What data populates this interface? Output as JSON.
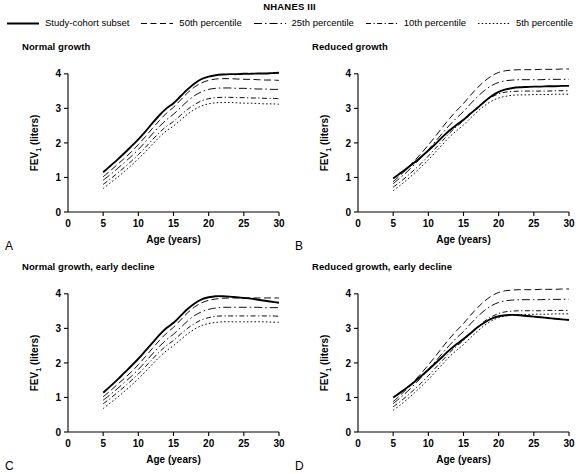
{
  "legend": {
    "title": "NHANES III",
    "items": [
      {
        "label": "Study-cohort subset",
        "style": "solid"
      },
      {
        "label": "50th percentile",
        "style": "dashed"
      },
      {
        "label": "25th percentile",
        "style": "dash-dot"
      },
      {
        "label": "10th percentile",
        "style": "dash-dot-dot"
      },
      {
        "label": "5th percentile",
        "style": "dotted"
      }
    ]
  },
  "axes": {
    "xlabel": "Age (years)",
    "ylabel_main": "FEV",
    "ylabel_sub": "1",
    "ylabel_unit": " (liters)",
    "xticks": [
      "0",
      "5",
      "10",
      "15",
      "20",
      "25",
      "30"
    ],
    "yticks": [
      "0",
      "1",
      "2",
      "3",
      "4"
    ],
    "xlim": [
      0,
      30
    ],
    "ylim": [
      0,
      4.4
    ]
  },
  "panels": [
    {
      "letter": "A",
      "title": "Normal growth"
    },
    {
      "letter": "B",
      "title": "Reduced growth"
    },
    {
      "letter": "C",
      "title": "Normal growth, early decline"
    },
    {
      "letter": "D",
      "title": "Reduced growth, early decline"
    }
  ],
  "chart_data": {
    "type": "line",
    "title": "NHANES III",
    "xlabel": "Age (years)",
    "ylabel": "FEV1 (liters)",
    "xlim": [
      0,
      30
    ],
    "ylim": [
      0,
      4.4
    ],
    "grid": false,
    "legend_position": "top",
    "x": [
      5,
      6,
      7,
      8,
      9,
      10,
      11,
      12,
      13,
      14,
      15,
      16,
      17,
      18,
      19,
      20,
      21,
      22,
      23,
      24,
      25,
      26,
      27,
      28,
      29,
      30
    ],
    "panels": [
      {
        "letter": "A",
        "title": "Normal growth",
        "series": [
          {
            "name": "Study-cohort subset",
            "style": "solid",
            "values": [
              1.15,
              1.33,
              1.51,
              1.7,
              1.9,
              2.1,
              2.33,
              2.57,
              2.8,
              3.0,
              3.15,
              3.35,
              3.55,
              3.72,
              3.85,
              3.92,
              3.96,
              3.98,
              3.99,
              3.99,
              4.0,
              4.0,
              4.01,
              4.01,
              4.02,
              4.03
            ]
          },
          {
            "name": "50th percentile",
            "style": "dashed",
            "values": [
              1.02,
              1.19,
              1.37,
              1.55,
              1.74,
              1.95,
              2.18,
              2.42,
              2.65,
              2.86,
              3.03,
              3.24,
              3.45,
              3.62,
              3.74,
              3.81,
              3.85,
              3.86,
              3.86,
              3.85,
              3.84,
              3.84,
              3.83,
              3.82,
              3.82,
              3.81
            ]
          },
          {
            "name": "25th percentile",
            "style": "dash-dot",
            "values": [
              0.92,
              1.08,
              1.25,
              1.43,
              1.61,
              1.81,
              2.03,
              2.26,
              2.48,
              2.67,
              2.83,
              3.02,
              3.21,
              3.37,
              3.48,
              3.55,
              3.58,
              3.59,
              3.59,
              3.58,
              3.58,
              3.57,
              3.56,
              3.56,
              3.55,
              3.55
            ]
          },
          {
            "name": "10th percentile",
            "style": "dash-dot-dot",
            "values": [
              0.8,
              0.95,
              1.12,
              1.29,
              1.47,
              1.66,
              1.87,
              2.09,
              2.3,
              2.48,
              2.62,
              2.8,
              2.97,
              3.11,
              3.22,
              3.28,
              3.31,
              3.32,
              3.32,
              3.31,
              3.31,
              3.3,
              3.3,
              3.29,
              3.29,
              3.28
            ]
          },
          {
            "name": "5th percentile",
            "style": "dotted",
            "values": [
              0.68,
              0.84,
              1.0,
              1.17,
              1.35,
              1.54,
              1.74,
              1.96,
              2.17,
              2.35,
              2.49,
              2.66,
              2.83,
              2.97,
              3.07,
              3.13,
              3.16,
              3.17,
              3.17,
              3.16,
              3.15,
              3.15,
              3.14,
              3.13,
              3.13,
              3.12
            ]
          }
        ]
      },
      {
        "letter": "B",
        "title": "Reduced growth",
        "series": [
          {
            "name": "Study-cohort subset",
            "style": "solid",
            "values": [
              0.97,
              1.12,
              1.27,
              1.43,
              1.6,
              1.78,
              1.97,
              2.17,
              2.36,
              2.52,
              2.67,
              2.85,
              3.02,
              3.2,
              3.36,
              3.48,
              3.55,
              3.59,
              3.61,
              3.62,
              3.63,
              3.63,
              3.64,
              3.64,
              3.65,
              3.65
            ]
          },
          {
            "name": "50th percentile",
            "style": "dashed",
            "values": [
              0.88,
              1.06,
              1.26,
              1.48,
              1.7,
              1.94,
              2.19,
              2.45,
              2.7,
              2.93,
              3.14,
              3.38,
              3.6,
              3.79,
              3.94,
              4.04,
              4.09,
              4.11,
              4.12,
              4.12,
              4.12,
              4.13,
              4.13,
              4.13,
              4.14,
              4.14
            ]
          },
          {
            "name": "25th percentile",
            "style": "dash-dot",
            "values": [
              0.82,
              0.99,
              1.17,
              1.37,
              1.58,
              1.8,
              2.04,
              2.28,
              2.51,
              2.72,
              2.91,
              3.13,
              3.34,
              3.52,
              3.66,
              3.75,
              3.8,
              3.82,
              3.83,
              3.83,
              3.83,
              3.83,
              3.84,
              3.84,
              3.84,
              3.84
            ]
          },
          {
            "name": "10th percentile",
            "style": "dash-dot-dot",
            "values": [
              0.72,
              0.87,
              1.04,
              1.22,
              1.41,
              1.62,
              1.84,
              2.06,
              2.28,
              2.47,
              2.64,
              2.84,
              3.03,
              3.2,
              3.33,
              3.42,
              3.47,
              3.49,
              3.5,
              3.5,
              3.5,
              3.5,
              3.5,
              3.51,
              3.51,
              3.51
            ]
          },
          {
            "name": "5th percentile",
            "style": "dotted",
            "values": [
              0.62,
              0.77,
              0.94,
              1.12,
              1.31,
              1.51,
              1.73,
              1.95,
              2.17,
              2.35,
              2.52,
              2.72,
              2.91,
              3.08,
              3.21,
              3.3,
              3.35,
              3.38,
              3.39,
              3.39,
              3.4,
              3.4,
              3.4,
              3.41,
              3.41,
              3.41
            ]
          }
        ]
      },
      {
        "letter": "C",
        "title": "Normal growth, early decline",
        "series": [
          {
            "name": "Study-cohort subset",
            "style": "solid",
            "values": [
              1.14,
              1.32,
              1.51,
              1.71,
              1.91,
              2.12,
              2.35,
              2.58,
              2.81,
              3.01,
              3.16,
              3.36,
              3.56,
              3.72,
              3.84,
              3.9,
              3.93,
              3.93,
              3.92,
              3.9,
              3.88,
              3.86,
              3.83,
              3.8,
              3.77,
              3.74
            ]
          },
          {
            "name": "50th percentile",
            "style": "dashed",
            "values": [
              1.02,
              1.19,
              1.37,
              1.55,
              1.74,
              1.95,
              2.18,
              2.42,
              2.65,
              2.86,
              3.03,
              3.24,
              3.45,
              3.62,
              3.74,
              3.81,
              3.85,
              3.87,
              3.88,
              3.88,
              3.88,
              3.88,
              3.88,
              3.88,
              3.88,
              3.88
            ]
          },
          {
            "name": "25th percentile",
            "style": "dash-dot",
            "values": [
              0.92,
              1.08,
              1.25,
              1.43,
              1.61,
              1.81,
              2.03,
              2.26,
              2.48,
              2.67,
              2.83,
              3.02,
              3.21,
              3.37,
              3.48,
              3.55,
              3.59,
              3.61,
              3.61,
              3.61,
              3.61,
              3.61,
              3.61,
              3.6,
              3.6,
              3.6
            ]
          },
          {
            "name": "10th percentile",
            "style": "dash-dot-dot",
            "values": [
              0.82,
              0.97,
              1.14,
              1.31,
              1.49,
              1.68,
              1.89,
              2.11,
              2.32,
              2.5,
              2.65,
              2.83,
              3.0,
              3.14,
              3.25,
              3.31,
              3.35,
              3.36,
              3.36,
              3.36,
              3.36,
              3.36,
              3.36,
              3.36,
              3.36,
              3.35
            ]
          },
          {
            "name": "5th percentile",
            "style": "dotted",
            "values": [
              0.68,
              0.84,
              1.0,
              1.17,
              1.35,
              1.54,
              1.75,
              1.96,
              2.17,
              2.35,
              2.5,
              2.67,
              2.84,
              2.98,
              3.08,
              3.14,
              3.17,
              3.19,
              3.19,
              3.19,
              3.19,
              3.19,
              3.19,
              3.19,
              3.18,
              3.18
            ]
          }
        ]
      },
      {
        "letter": "D",
        "title": "Reduced growth, early decline",
        "series": [
          {
            "name": "Study-cohort subset",
            "style": "solid",
            "values": [
              1.0,
              1.14,
              1.29,
              1.45,
              1.62,
              1.8,
              1.99,
              2.18,
              2.37,
              2.54,
              2.69,
              2.86,
              3.03,
              3.17,
              3.28,
              3.35,
              3.38,
              3.39,
              3.38,
              3.36,
              3.34,
              3.32,
              3.3,
              3.28,
              3.26,
              3.24
            ]
          },
          {
            "name": "50th percentile",
            "style": "dashed",
            "values": [
              0.88,
              1.06,
              1.26,
              1.48,
              1.7,
              1.94,
              2.19,
              2.45,
              2.7,
              2.93,
              3.14,
              3.38,
              3.6,
              3.79,
              3.94,
              4.04,
              4.09,
              4.11,
              4.12,
              4.12,
              4.12,
              4.13,
              4.13,
              4.13,
              4.14,
              4.14
            ]
          },
          {
            "name": "25th percentile",
            "style": "dash-dot",
            "values": [
              0.82,
              0.99,
              1.17,
              1.37,
              1.58,
              1.8,
              2.04,
              2.28,
              2.51,
              2.72,
              2.91,
              3.13,
              3.34,
              3.52,
              3.66,
              3.75,
              3.8,
              3.82,
              3.83,
              3.83,
              3.83,
              3.83,
              3.84,
              3.84,
              3.84,
              3.84
            ]
          },
          {
            "name": "10th percentile",
            "style": "dash-dot-dot",
            "values": [
              0.73,
              0.88,
              1.05,
              1.23,
              1.42,
              1.63,
              1.85,
              2.07,
              2.29,
              2.48,
              2.65,
              2.85,
              3.04,
              3.21,
              3.34,
              3.43,
              3.48,
              3.5,
              3.51,
              3.51,
              3.51,
              3.51,
              3.52,
              3.52,
              3.52,
              3.52
            ]
          },
          {
            "name": "5th percentile",
            "style": "dotted",
            "values": [
              0.63,
              0.78,
              0.95,
              1.13,
              1.32,
              1.52,
              1.74,
              1.96,
              2.18,
              2.36,
              2.53,
              2.73,
              2.92,
              3.09,
              3.22,
              3.31,
              3.36,
              3.39,
              3.4,
              3.4,
              3.41,
              3.41,
              3.41,
              3.42,
              3.42,
              3.42
            ]
          }
        ]
      }
    ]
  }
}
